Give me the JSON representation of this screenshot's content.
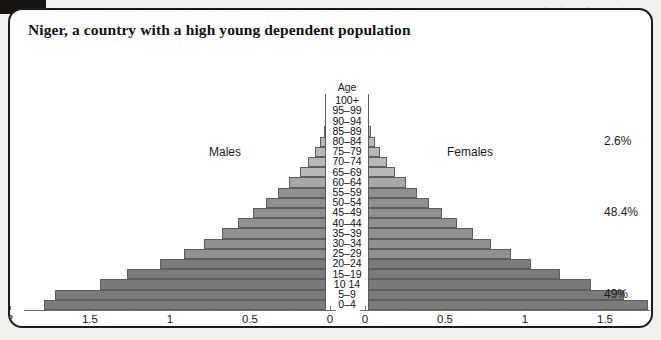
{
  "card": {
    "title": "Niger, a country with a high young dependent population"
  },
  "background_bleed": [
    "population dependent",
    "high a with",
    "a in population dependent young high a with country a",
    "a and population dependent",
    "Population (in millions)",
    "Population (in millions)"
  ],
  "chart_data": {
    "type": "bar",
    "subtype": "population-pyramid",
    "title": "Niger, a country with a high young dependent population",
    "age_axis_label": "Age",
    "left_label": "Males",
    "right_label": "Females",
    "xlabel_left": "Population (in millions)",
    "xlabel_right": "Population (in millions)",
    "ylabel": "Age",
    "grid": false,
    "legend_position": "none",
    "units": "millions",
    "left_axis_ticks": [
      "2",
      "1.5",
      "1",
      "0.5",
      "0"
    ],
    "left_axis_tick_values": [
      2,
      1.5,
      1,
      0.5,
      0
    ],
    "right_axis_ticks": [
      "0",
      "0.5",
      "1",
      "1.5"
    ],
    "right_axis_tick_values": [
      0,
      0.5,
      1,
      1.5
    ],
    "xlim_left": [
      2,
      0
    ],
    "xlim_right": [
      0,
      1.9
    ],
    "categories": [
      "100+",
      "95–99",
      "90–94",
      "85–89",
      "80–84",
      "75–79",
      "70–74",
      "65–69",
      "60–64",
      "55–59",
      "50–54",
      "45–49",
      "40–44",
      "35–39",
      "30–34",
      "25–29",
      "20–24",
      "15–19",
      "10  14",
      "5–9",
      "0–4"
    ],
    "series": [
      {
        "name": "Males",
        "side": "left",
        "values": [
          0.005,
          0.012,
          0.022,
          0.04,
          0.065,
          0.095,
          0.135,
          0.19,
          0.255,
          0.325,
          0.4,
          0.48,
          0.575,
          0.675,
          0.79,
          0.915,
          1.06,
          1.27,
          1.44,
          1.72,
          1.79
        ]
      },
      {
        "name": "Females",
        "side": "right",
        "values": [
          0.005,
          0.012,
          0.022,
          0.04,
          0.065,
          0.095,
          0.135,
          0.19,
          0.255,
          0.325,
          0.4,
          0.48,
          0.575,
          0.675,
          0.79,
          0.915,
          1.04,
          1.22,
          1.41,
          1.62,
          1.77
        ]
      }
    ],
    "annotations": [
      {
        "text": "2.6%",
        "meaning": "share aged 65 and over",
        "y_category": "80–84"
      },
      {
        "text": "48.4%",
        "meaning": "share aged 15 to 64",
        "y_category": "45–49"
      },
      {
        "text": "49%",
        "meaning": "share aged under 15",
        "y_category": "5–9"
      }
    ]
  }
}
